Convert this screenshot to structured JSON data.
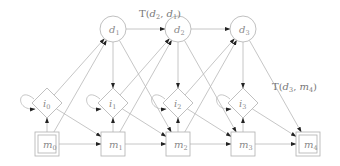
{
  "diagram": {
    "type": "state-transition-graph",
    "nodes": {
      "d": [
        {
          "id": "d1",
          "label": "d",
          "sub": "1",
          "shape": "circle",
          "x": 113,
          "y": 29
        },
        {
          "id": "d2",
          "label": "d",
          "sub": "2",
          "shape": "circle",
          "x": 178,
          "y": 29
        },
        {
          "id": "d3",
          "label": "d",
          "sub": "3",
          "shape": "circle",
          "x": 243,
          "y": 29
        }
      ],
      "i": [
        {
          "id": "i0",
          "label": "i",
          "sub": "0",
          "shape": "diamond",
          "x": 47,
          "y": 103
        },
        {
          "id": "i1",
          "label": "i",
          "sub": "1",
          "shape": "diamond",
          "x": 113,
          "y": 103
        },
        {
          "id": "i2",
          "label": "i",
          "sub": "2",
          "shape": "diamond",
          "x": 178,
          "y": 103
        },
        {
          "id": "i3",
          "label": "i",
          "sub": "3",
          "shape": "diamond",
          "x": 243,
          "y": 103
        }
      ],
      "m": [
        {
          "id": "m0",
          "label": "m",
          "sub": "0",
          "shape": "double-square",
          "x": 47,
          "y": 144
        },
        {
          "id": "m1",
          "label": "m",
          "sub": "1",
          "shape": "square",
          "x": 113,
          "y": 144
        },
        {
          "id": "m2",
          "label": "m",
          "sub": "2",
          "shape": "square",
          "x": 178,
          "y": 144
        },
        {
          "id": "m3",
          "label": "m",
          "sub": "3",
          "shape": "square",
          "x": 243,
          "y": 144
        },
        {
          "id": "m4",
          "label": "m",
          "sub": "4",
          "shape": "double-square",
          "x": 308,
          "y": 144
        }
      ]
    },
    "edge_labels": [
      {
        "text_prefix": "T(",
        "a": "d",
        "a_sub": "2",
        "sep": ", ",
        "b": "d",
        "b_sub": "1",
        "suffix": ")",
        "x": 139,
        "y": 17
      },
      {
        "text_prefix": "T(",
        "a": "d",
        "a_sub": "3",
        "sep": ", ",
        "b": "m",
        "b_sub": "4",
        "suffix": ")",
        "x": 272,
        "y": 90
      }
    ],
    "edges": [
      "d1->d2",
      "d2->d3",
      "d1->i1",
      "d2->i2",
      "d3->i3",
      "d1->m2",
      "d2->m3",
      "d3->m4",
      "i0->d1",
      "i1->d2",
      "i2->d3",
      "m0->d1",
      "m1->d2",
      "m2->d3",
      "i0->m1",
      "i1->m2",
      "i2->m3",
      "i3->m4",
      "m0->i0",
      "m1->i1",
      "m2->i2",
      "m3->i3",
      "m0->m1",
      "m1->m2",
      "m2->m3",
      "m3->m4",
      "i0->i0",
      "i1->i1",
      "i2->i2",
      "i3->i3"
    ],
    "colors": {
      "stroke": "#b0b0b0",
      "arrowhead": "#222222",
      "label": "#8a8a8a"
    }
  }
}
